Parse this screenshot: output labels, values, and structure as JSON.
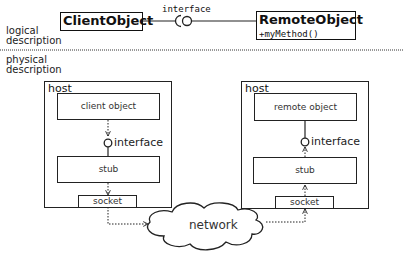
{
  "logical": {
    "label_line1": "logical",
    "label_line2": "description",
    "client_class": "ClientObject",
    "interface_label": "interface",
    "remote_class": "RemoteObject",
    "remote_method": "+myMethod()"
  },
  "physical": {
    "label_line1": "physical",
    "label_line2": "description",
    "left_host": {
      "label": "host",
      "object": "client object",
      "interface": "interface",
      "stub": "stub",
      "socket": "socket"
    },
    "right_host": {
      "label": "host",
      "object": "remote object",
      "interface": "interface",
      "stub": "stub",
      "socket": "socket"
    },
    "network": "network"
  }
}
